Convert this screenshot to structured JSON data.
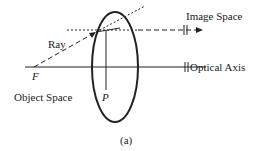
{
  "diagram": {
    "labels": {
      "ray": "Ray",
      "image_space": "Image Space",
      "optical_axis": "Optical Axis",
      "object_space": "Object Space",
      "focal_point": "F",
      "point": "P",
      "caption": "(a)"
    },
    "colors": {
      "stroke": "#222222",
      "background": "#ffffff"
    }
  }
}
